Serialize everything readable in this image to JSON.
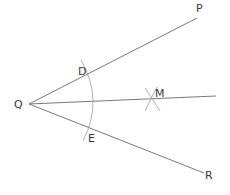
{
  "diagram": {
    "vertex": {
      "label": "Q",
      "x": 29,
      "y": 104,
      "label_x": 14,
      "label_y": 108
    },
    "rays": [
      {
        "name": "QP",
        "end_label": "P",
        "x2": 197,
        "y2": 18,
        "label_x": 196,
        "label_y": 12
      },
      {
        "name": "QR",
        "end_label": "R",
        "x2": 204,
        "y2": 173,
        "label_x": 205,
        "label_y": 179
      },
      {
        "name": "QM",
        "end_label": "",
        "x2": 216,
        "y2": 96
      }
    ],
    "points": [
      {
        "label": "D",
        "x": 89,
        "y": 73,
        "label_x": 78,
        "label_y": 75
      },
      {
        "label": "E",
        "x": 92,
        "y": 129,
        "label_x": 88,
        "label_y": 142
      },
      {
        "label": "M",
        "x": 152,
        "y": 98,
        "label_x": 155,
        "label_y": 97
      }
    ],
    "colors": {
      "line": "#7a7a7a",
      "arc": "#9a9a9a",
      "text": "#3a3a3a",
      "background": "#ffffff"
    }
  }
}
